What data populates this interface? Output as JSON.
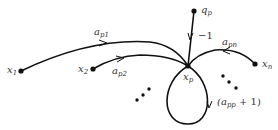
{
  "diagram": {
    "type": "signal-flow-graph",
    "nodes": [
      {
        "id": "x1",
        "base": "x",
        "sub": "1"
      },
      {
        "id": "x2",
        "base": "x",
        "sub": "2"
      },
      {
        "id": "xp",
        "base": "x",
        "sub": "p"
      },
      {
        "id": "qp",
        "base": "q",
        "sub": "p"
      },
      {
        "id": "xn",
        "base": "x",
        "sub": "n"
      }
    ],
    "edges": [
      {
        "from": "x1",
        "to": "xp",
        "label_base": "a",
        "label_sub": "p1"
      },
      {
        "from": "x2",
        "to": "xp",
        "label_base": "a",
        "label_sub": "p2"
      },
      {
        "from": "qp",
        "to": "xp",
        "label": "−1"
      },
      {
        "from": "xn",
        "to": "xp",
        "label_base": "a",
        "label_sub": "pn"
      },
      {
        "from": "xp",
        "to": "xp",
        "label_prefix": "(a",
        "label_sub": "pp",
        "label_suffix": " + 1)"
      }
    ],
    "ellipsis": [
      "•",
      "•",
      "•"
    ]
  }
}
